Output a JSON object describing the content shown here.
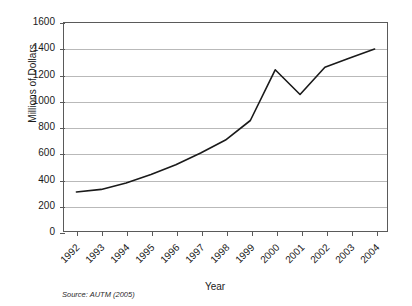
{
  "chart_data": {
    "type": "line",
    "title": "",
    "xlabel": "Year",
    "ylabel": "Millions of Dollars",
    "categories": [
      "1992",
      "1993",
      "1994",
      "1995",
      "1996",
      "1997",
      "1998",
      "1999",
      "2000",
      "2001",
      "2002",
      "2003",
      "2004"
    ],
    "values": [
      300,
      320,
      370,
      435,
      510,
      600,
      700,
      850,
      1240,
      1050,
      1260,
      1330,
      1400
    ],
    "series": [
      {
        "name": "Licensing Revenue",
        "values": [
          300,
          320,
          370,
          435,
          510,
          600,
          700,
          850,
          1240,
          1050,
          1260,
          1330,
          1400
        ]
      }
    ],
    "ylim": [
      0,
      1600
    ],
    "ytick_step": 200,
    "yticks": [
      "1600",
      "1400",
      "1200",
      "1000",
      "800",
      "600",
      "400",
      "200",
      "0"
    ],
    "grid": "horizontal",
    "legend": "none",
    "line_color": "#1a1a1a",
    "grid_color": "#b9b9b9",
    "axis_color": "#5a5a5a",
    "source_note": "Source: AUTM (2005)"
  }
}
